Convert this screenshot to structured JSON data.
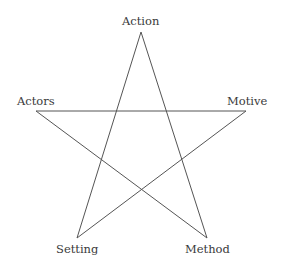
{
  "diagram": {
    "type": "pentagram",
    "line_color": "#555555",
    "text_color": "#3a3a3a",
    "nodes": [
      {
        "id": "action",
        "label": "Action",
        "x": 141,
        "y": 32
      },
      {
        "id": "motive",
        "label": "Motive",
        "x": 246,
        "y": 111
      },
      {
        "id": "method",
        "label": "Method",
        "x": 207,
        "y": 238
      },
      {
        "id": "setting",
        "label": "Setting",
        "x": 77,
        "y": 238
      },
      {
        "id": "actors",
        "label": "Actors",
        "x": 36,
        "y": 111
      }
    ],
    "edges": [
      [
        "action",
        "setting"
      ],
      [
        "action",
        "method"
      ],
      [
        "actors",
        "motive"
      ],
      [
        "actors",
        "method"
      ],
      [
        "motive",
        "setting"
      ]
    ]
  }
}
